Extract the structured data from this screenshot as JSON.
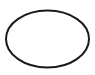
{
  "shape": {
    "type": "ellipse",
    "cx": 47.5,
    "cy": 39,
    "rx": 41.5,
    "ry": 28.5,
    "stroke": "#1a1a1a",
    "stroke_width": 2,
    "fill": "none"
  },
  "background": "#ffffff"
}
